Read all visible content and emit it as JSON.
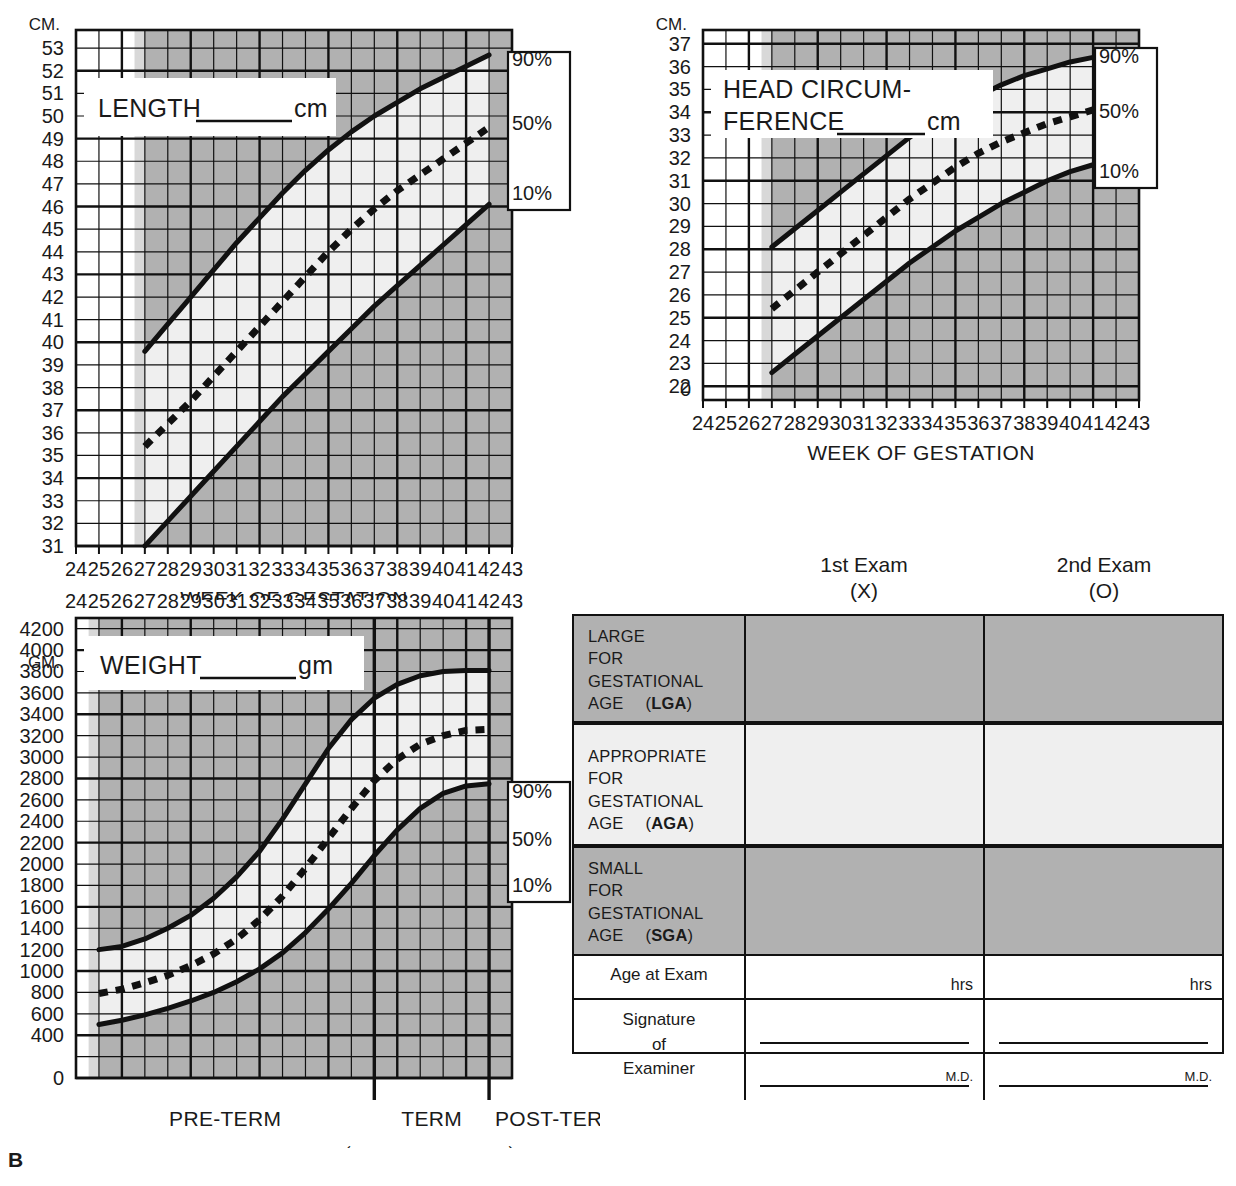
{
  "figure": {
    "label": "B"
  },
  "charts": {
    "length": {
      "unit": "CM.",
      "box_label": "LENGTH",
      "box_suffix": "cm",
      "xlabel": "WEEK OF GESTATION",
      "xticks": [
        24,
        25,
        26,
        27,
        28,
        29,
        30,
        31,
        32,
        33,
        34,
        35,
        36,
        37,
        38,
        39,
        40,
        41,
        42,
        43
      ],
      "yticks": [
        53,
        52,
        51,
        50,
        49,
        48,
        47,
        46,
        45,
        44,
        43,
        42,
        41,
        40,
        39,
        38,
        37,
        36,
        35,
        34,
        33,
        32,
        31
      ],
      "percentiles": [
        "90%",
        "50%",
        "10%"
      ]
    },
    "head": {
      "unit": "CM.",
      "box_label_line1": "HEAD CIRCUM-",
      "box_label_line2": "FERENCE",
      "box_suffix": "cm",
      "xlabel": "WEEK OF GESTATION",
      "xticks": [
        24,
        25,
        26,
        27,
        28,
        29,
        30,
        31,
        32,
        33,
        34,
        35,
        36,
        37,
        38,
        39,
        40,
        41,
        42,
        43
      ],
      "yticks": [
        37,
        36,
        35,
        34,
        33,
        32,
        31,
        30,
        29,
        28,
        27,
        26,
        25,
        24,
        23,
        22,
        "0"
      ],
      "percentiles": [
        "90%",
        "50%",
        "10%"
      ]
    },
    "weight": {
      "unit": "GM.",
      "box_label": "WEIGHT",
      "box_suffix": "gm",
      "xticks": [
        24,
        25,
        26,
        27,
        28,
        29,
        30,
        31,
        32,
        33,
        34,
        35,
        36,
        37,
        38,
        39,
        40,
        41,
        42,
        43
      ],
      "yticks": [
        4200,
        4000,
        3800,
        3600,
        3400,
        3200,
        3000,
        2800,
        2600,
        2400,
        2200,
        2000,
        1800,
        1600,
        1400,
        1200,
        1000,
        800,
        600,
        400,
        "0"
      ],
      "percentiles": [
        "90%",
        "50%",
        "10%"
      ],
      "term_labels": [
        "PRE-TERM",
        "TERM",
        "POST-TERM"
      ],
      "arrows": [
        "←",
        "→"
      ]
    }
  },
  "chart_data": [
    {
      "type": "line",
      "title": "LENGTH cm",
      "xlabel": "WEEK OF GESTATION",
      "ylabel": "CM.",
      "x": [
        27,
        28,
        29,
        30,
        31,
        32,
        33,
        34,
        35,
        36,
        37,
        38,
        39,
        40,
        41,
        42
      ],
      "xlim": [
        24,
        43
      ],
      "ylim": [
        31,
        53.8
      ],
      "grid": true,
      "series": [
        {
          "name": "90%",
          "style": "solid",
          "values": [
            39.6,
            40.8,
            42.0,
            43.2,
            44.4,
            45.5,
            46.6,
            47.6,
            48.5,
            49.3,
            50.0,
            50.6,
            51.2,
            51.7,
            52.2,
            52.7
          ]
        },
        {
          "name": "50%",
          "style": "dashed",
          "values": [
            35.4,
            36.4,
            37.4,
            38.5,
            39.6,
            40.7,
            41.8,
            42.9,
            44.0,
            45.0,
            45.9,
            46.7,
            47.4,
            48.1,
            48.8,
            49.5
          ]
        },
        {
          "name": "10%",
          "style": "solid",
          "values": [
            31.0,
            32.1,
            33.2,
            34.3,
            35.4,
            36.5,
            37.6,
            38.6,
            39.6,
            40.6,
            41.6,
            42.5,
            43.4,
            44.3,
            45.2,
            46.1
          ]
        }
      ]
    },
    {
      "type": "line",
      "title": "HEAD CIRCUMFERENCE cm",
      "xlabel": "WEEK OF GESTATION",
      "ylabel": "CM.",
      "x": [
        27,
        28,
        29,
        30,
        31,
        32,
        33,
        34,
        35,
        36,
        37,
        38,
        39,
        40,
        41,
        42
      ],
      "xlim": [
        24,
        43
      ],
      "ylim": [
        21.4,
        37.6
      ],
      "grid": true,
      "series": [
        {
          "name": "90%",
          "style": "solid",
          "values": [
            28.1,
            28.9,
            29.7,
            30.5,
            31.3,
            32.1,
            32.9,
            33.6,
            34.2,
            34.7,
            35.2,
            35.6,
            35.9,
            36.2,
            36.4,
            36.6
          ]
        },
        {
          "name": "50%",
          "style": "dashed",
          "values": [
            25.4,
            26.2,
            27.0,
            27.8,
            28.6,
            29.4,
            30.2,
            30.9,
            31.6,
            32.2,
            32.7,
            33.1,
            33.5,
            33.8,
            34.1,
            34.3
          ]
        },
        {
          "name": "10%",
          "style": "solid",
          "values": [
            22.6,
            23.4,
            24.2,
            25.0,
            25.8,
            26.6,
            27.4,
            28.1,
            28.8,
            29.4,
            30.0,
            30.5,
            31.0,
            31.4,
            31.7,
            32.0
          ]
        }
      ]
    },
    {
      "type": "line",
      "title": "WEIGHT gm",
      "xlabel": "WEEK OF GESTATION",
      "ylabel": "GM.",
      "x": [
        25,
        26,
        27,
        28,
        29,
        30,
        31,
        32,
        33,
        34,
        35,
        36,
        37,
        38,
        39,
        40,
        41,
        42
      ],
      "xlim": [
        24,
        43
      ],
      "ylim": [
        0,
        4300
      ],
      "grid": true,
      "series": [
        {
          "name": "90%",
          "style": "solid",
          "values": [
            1200,
            1230,
            1300,
            1400,
            1520,
            1680,
            1880,
            2120,
            2420,
            2750,
            3080,
            3350,
            3550,
            3680,
            3760,
            3800,
            3810,
            3810
          ]
        },
        {
          "name": "50%",
          "style": "dashed",
          "values": [
            790,
            830,
            890,
            960,
            1050,
            1160,
            1300,
            1480,
            1700,
            1960,
            2240,
            2520,
            2780,
            2980,
            3120,
            3200,
            3250,
            3260
          ]
        },
        {
          "name": "10%",
          "style": "solid",
          "values": [
            500,
            540,
            590,
            650,
            720,
            800,
            900,
            1020,
            1170,
            1360,
            1580,
            1820,
            2080,
            2320,
            2520,
            2660,
            2730,
            2750
          ]
        }
      ]
    }
  ],
  "exam_table": {
    "columns": [
      {
        "title": "1st Exam",
        "marker": "(X)"
      },
      {
        "title": "2nd Exam",
        "marker": "(O)"
      }
    ],
    "rows": [
      {
        "lines": [
          "LARGE",
          "FOR",
          "GESTATIONAL",
          "AGE"
        ],
        "abbr": "LGA",
        "shade": "dark"
      },
      {
        "lines": [
          "APPROPRIATE",
          "FOR",
          "GESTATIONAL",
          "AGE"
        ],
        "abbr": "AGA",
        "shade": "light"
      },
      {
        "lines": [
          "SMALL",
          "FOR",
          "GESTATIONAL",
          "AGE"
        ],
        "abbr": "SGA",
        "shade": "dark"
      }
    ],
    "age_row": {
      "label": "Age at Exam",
      "unit": "hrs"
    },
    "signature_row": {
      "label_lines": [
        "Signature",
        "of",
        "Examiner"
      ],
      "credential": "M.D."
    }
  },
  "colors": {
    "dark_shade": "#b1b1b1",
    "light_shade": "#efefef",
    "mid_shade": "#d8d8d8",
    "line": "#111111",
    "white": "#ffffff"
  }
}
